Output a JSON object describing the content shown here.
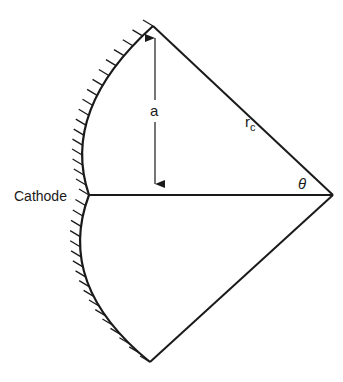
{
  "diagram": {
    "labels": {
      "cathode": "Cathode",
      "height": "a",
      "radius": "r",
      "radius_sub": "c",
      "angle": "θ"
    },
    "points": {
      "top": [
        153,
        26
      ],
      "apex": [
        333,
        195
      ],
      "arc_mid": [
        89,
        195
      ],
      "bottom": [
        150,
        362
      ],
      "foot": [
        155,
        195
      ]
    },
    "colors": {
      "stroke": "#1a1a1a",
      "background": "#ffffff"
    }
  }
}
